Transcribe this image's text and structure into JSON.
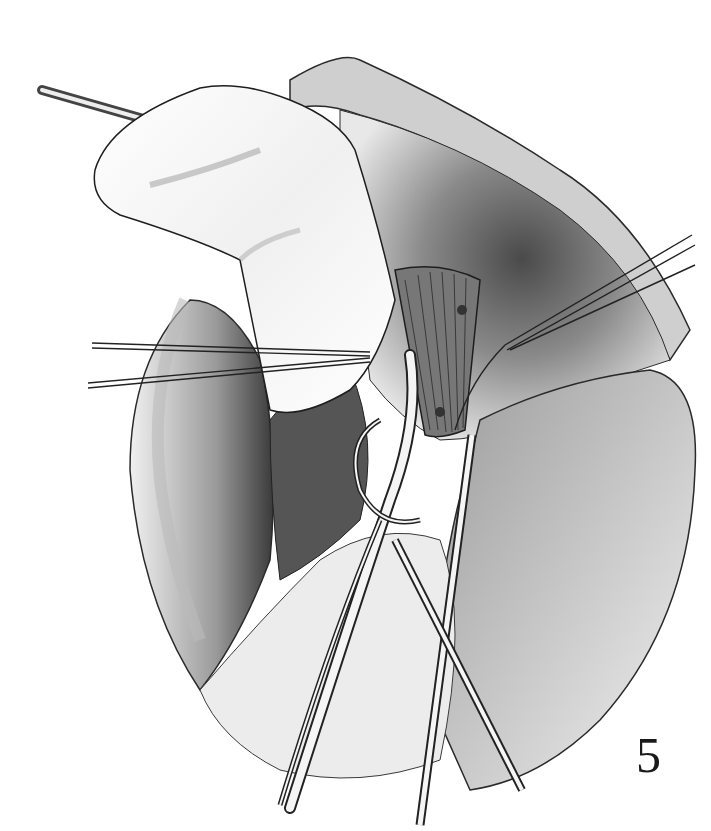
{
  "figure": {
    "number": "5",
    "palette": {
      "ink": "#1a1a1a",
      "dark": "#3a3a3a",
      "mid": "#8a8a8a",
      "light": "#d8d8d8",
      "paper": "#ffffff"
    }
  }
}
